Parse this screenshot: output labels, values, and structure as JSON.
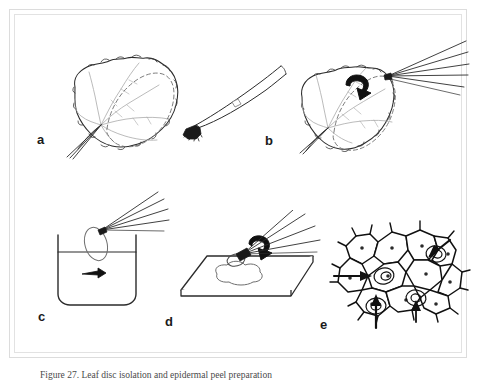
{
  "figure": {
    "caption": "Figure 27. Leaf disc isolation and epidermal peel preparation",
    "panels": [
      {
        "id": "a",
        "label": "a",
        "name": "panel-a-leaf-with-marked-region",
        "description": "Leaf outline with palmate venation and dashed ellipse marking the region to be sampled"
      },
      {
        "id": "b",
        "label": "b",
        "name": "panel-b-forceps-brush-tool",
        "description": "Fine forceps / brush tool with dark bristle tip shown at an angle"
      },
      {
        "id": "c",
        "label": "b-right",
        "name": "panel-b-right-leaf-with-tool",
        "description": "Leaf held with the tool at the upper right, curved arrow indicating peeling motion"
      },
      {
        "id": "d",
        "label": "c",
        "name": "panel-c-beaker-rinse",
        "description": "Beaker containing liquid, oval tissue piece held by tool above the surface, small arrow in liquid"
      },
      {
        "id": "e",
        "label": "d",
        "name": "panel-d-microscope-slide",
        "description": "Microscope slide with a droplet, tool placing the tissue, bold curved arrow"
      },
      {
        "id": "f",
        "label": "e",
        "name": "panel-e-epidermal-cells",
        "description": "Epidermal cell layer with nuclei; arrows point to four individual cells"
      }
    ],
    "colors": {
      "frame": "#dcdcdc",
      "frame_inner": "#e2e2e2",
      "ink": "#222222",
      "ink_light": "#9a9a9a",
      "ink_mid": "#5a5a5a",
      "background": "#ffffff"
    }
  }
}
